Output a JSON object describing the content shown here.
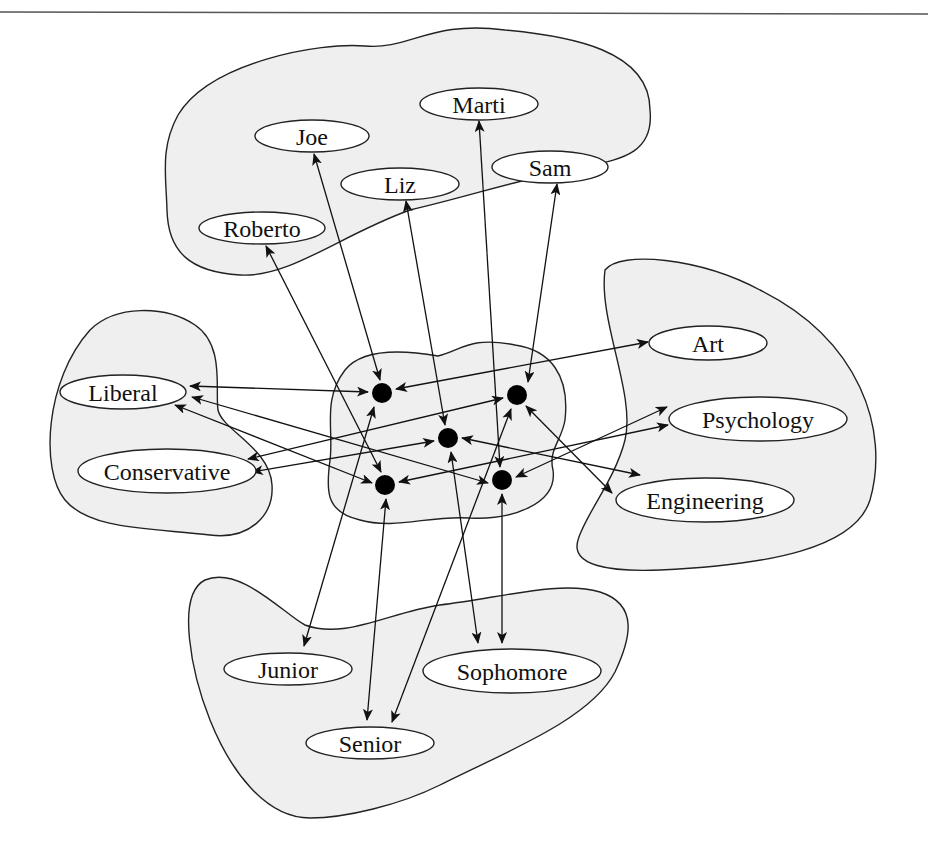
{
  "diagram": {
    "type": "bipartite-mapping",
    "colors": {
      "region_fill": "#efefef",
      "stroke": "#222222",
      "dot": "#000000",
      "background": "#ffffff"
    },
    "groups": [
      {
        "id": "names",
        "nodes": [
          {
            "id": "joe",
            "label": "Joe",
            "x": 312,
            "y": 136,
            "rx": 57,
            "ry": 16
          },
          {
            "id": "marti",
            "label": "Marti",
            "x": 479,
            "y": 104,
            "rx": 59,
            "ry": 16
          },
          {
            "id": "liz",
            "label": "Liz",
            "x": 400,
            "y": 184,
            "rx": 59,
            "ry": 16
          },
          {
            "id": "sam",
            "label": "Sam",
            "x": 550,
            "y": 167,
            "rx": 58,
            "ry": 16
          },
          {
            "id": "roberto",
            "label": "Roberto",
            "x": 262,
            "y": 228,
            "rx": 63,
            "ry": 16
          }
        ]
      },
      {
        "id": "politics",
        "nodes": [
          {
            "id": "liberal",
            "label": "Liberal",
            "x": 123,
            "y": 392,
            "rx": 63,
            "ry": 17
          },
          {
            "id": "conservative",
            "label": "Conservative",
            "x": 167,
            "y": 471,
            "rx": 89,
            "ry": 22
          }
        ]
      },
      {
        "id": "majors",
        "nodes": [
          {
            "id": "art",
            "label": "Art",
            "x": 708,
            "y": 343,
            "rx": 59,
            "ry": 17
          },
          {
            "id": "psychology",
            "label": "Psychology",
            "x": 758,
            "y": 419,
            "rx": 89,
            "ry": 22
          },
          {
            "id": "engineering",
            "label": "Engineering",
            "x": 705,
            "y": 500,
            "rx": 89,
            "ry": 22
          }
        ]
      },
      {
        "id": "years",
        "nodes": [
          {
            "id": "junior",
            "label": "Junior",
            "x": 288,
            "y": 669,
            "rx": 64,
            "ry": 16
          },
          {
            "id": "sophomore",
            "label": "Sophomore",
            "x": 512,
            "y": 671,
            "rx": 89,
            "ry": 22
          },
          {
            "id": "senior",
            "label": "Senior",
            "x": 370,
            "y": 743,
            "rx": 64,
            "ry": 16
          }
        ]
      }
    ],
    "points": [
      {
        "id": "A",
        "x": 382,
        "y": 393
      },
      {
        "id": "B",
        "x": 517,
        "y": 395
      },
      {
        "id": "C",
        "x": 448,
        "y": 438
      },
      {
        "id": "D",
        "x": 385,
        "y": 485
      },
      {
        "id": "E",
        "x": 502,
        "y": 480
      }
    ],
    "edges": [
      {
        "from": "A",
        "to": "joe",
        "x1": 380,
        "y1": 380,
        "x2": 314,
        "y2": 154
      },
      {
        "from": "D",
        "to": "roberto",
        "x1": 381,
        "y1": 472,
        "x2": 266,
        "y2": 246
      },
      {
        "from": "C",
        "to": "liz",
        "x1": 445,
        "y1": 425,
        "x2": 406,
        "y2": 201
      },
      {
        "from": "E",
        "to": "marti",
        "x1": 500,
        "y1": 467,
        "x2": 479,
        "y2": 121
      },
      {
        "from": "B",
        "to": "sam",
        "x1": 528,
        "y1": 382,
        "x2": 557,
        "y2": 184
      },
      {
        "from": "A",
        "to": "liberal",
        "x1": 368,
        "y1": 392,
        "x2": 190,
        "y2": 386
      },
      {
        "from": "E",
        "to": "liberal",
        "x1": 488,
        "y1": 483,
        "x2": 192,
        "y2": 397
      },
      {
        "from": "D",
        "to": "liberal",
        "x1": 372,
        "y1": 483,
        "x2": 175,
        "y2": 405
      },
      {
        "from": "B",
        "to": "conservative",
        "x1": 503,
        "y1": 398,
        "x2": 248,
        "y2": 459
      },
      {
        "from": "C",
        "to": "conservative",
        "x1": 434,
        "y1": 441,
        "x2": 252,
        "y2": 472
      },
      {
        "from": "A",
        "to": "art",
        "x1": 396,
        "y1": 389,
        "x2": 648,
        "y2": 342
      },
      {
        "from": "D",
        "to": "psychology",
        "x1": 399,
        "y1": 482,
        "x2": 668,
        "y2": 425
      },
      {
        "from": "E",
        "to": "psychology",
        "x1": 516,
        "y1": 477,
        "x2": 667,
        "y2": 407
      },
      {
        "from": "C",
        "to": "engineering",
        "x1": 462,
        "y1": 438,
        "x2": 640,
        "y2": 475
      },
      {
        "from": "B",
        "to": "engineering",
        "x1": 526,
        "y1": 406,
        "x2": 612,
        "y2": 493
      },
      {
        "from": "A",
        "to": "junior",
        "x1": 374,
        "y1": 407,
        "x2": 304,
        "y2": 646
      },
      {
        "from": "D",
        "to": "senior",
        "x1": 386,
        "y1": 499,
        "x2": 367,
        "y2": 720
      },
      {
        "from": "B",
        "to": "senior",
        "x1": 511,
        "y1": 409,
        "x2": 392,
        "y2": 722
      },
      {
        "from": "C",
        "to": "sophomore",
        "x1": 451,
        "y1": 452,
        "x2": 478,
        "y2": 643
      },
      {
        "from": "E",
        "to": "sophomore",
        "x1": 502,
        "y1": 494,
        "x2": 502,
        "y2": 643
      }
    ]
  }
}
